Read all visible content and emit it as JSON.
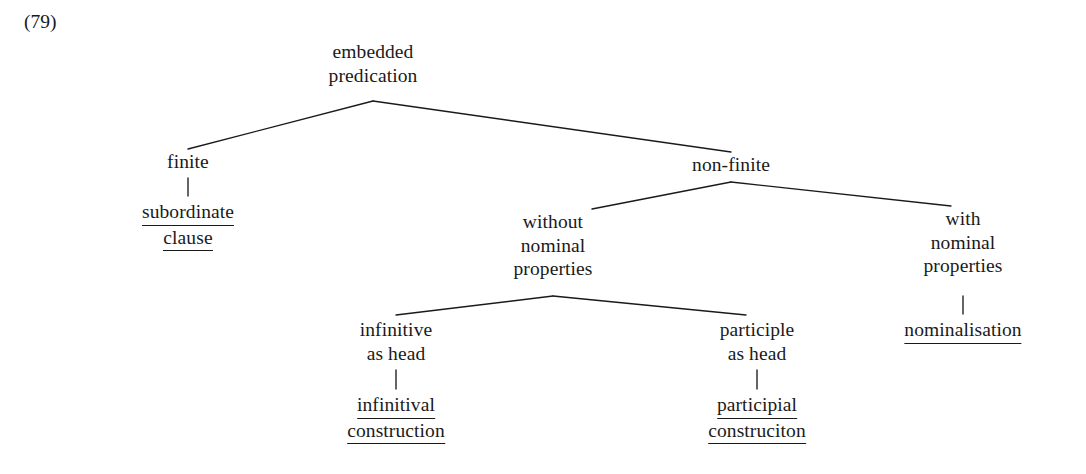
{
  "figure": {
    "example_number": "(79)",
    "root_label": "embedded predication"
  },
  "tree": {
    "root": {
      "lines": [
        "embedded",
        "predication"
      ],
      "underlined": false
    },
    "level2": {
      "finite": {
        "lines": [
          "finite"
        ],
        "underlined": false
      },
      "non_finite": {
        "lines": [
          "non-finite"
        ],
        "underlined": false
      }
    },
    "level3": {
      "subordinate_clause": {
        "lines": [
          "subordinate",
          "clause"
        ],
        "underlined": true
      },
      "without_nominal_properties": {
        "lines": [
          "without",
          "nominal",
          "properties"
        ],
        "underlined": false
      },
      "with_nominal_properties": {
        "lines": [
          "with",
          "nominal",
          "properties"
        ],
        "underlined": false
      }
    },
    "level4": {
      "infinitive_as_head": {
        "lines": [
          "infinitive",
          "as head"
        ],
        "underlined": false
      },
      "participle_as_head": {
        "lines": [
          "participle",
          "as head"
        ],
        "underlined": false
      },
      "nominalisation": {
        "lines": [
          "nominalisation"
        ],
        "underlined": true
      }
    },
    "level5": {
      "infinitival_construction": {
        "lines": [
          "infinitival",
          "construction"
        ],
        "underlined": true
      },
      "participial_construction": {
        "lines": [
          "participial",
          "construciton"
        ],
        "underlined": true
      }
    }
  },
  "style": {
    "line_color": "#1a1a1a",
    "text_color": "#1a1a1a",
    "background": "#ffffff"
  }
}
